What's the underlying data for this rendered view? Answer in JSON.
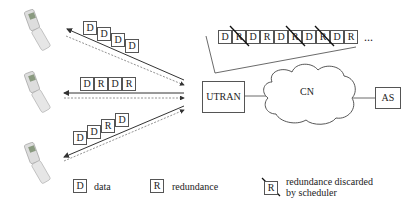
{
  "diagram": {
    "nodes": {
      "utran": "UTRAN",
      "cn": "CN",
      "as": "AS"
    },
    "ue_links": [
      {
        "ue": "ue-1",
        "packets": [
          "D",
          "D",
          "D",
          "D"
        ]
      },
      {
        "ue": "ue-2",
        "packets": [
          "D",
          "R",
          "D",
          "R"
        ]
      },
      {
        "ue": "ue-3",
        "packets": [
          "D",
          "D",
          "R",
          "D"
        ]
      }
    ],
    "queue": {
      "packets": [
        "D",
        "R",
        "D",
        "R",
        "D",
        "R",
        "D",
        "R",
        "D",
        "R"
      ],
      "discarded_indices": [
        1,
        5,
        7
      ],
      "ellipsis": "..."
    },
    "legend": {
      "data_symbol": "D",
      "data_label": "data",
      "redundancy_symbol": "R",
      "redundancy_label": "redundance",
      "discarded_symbol": "R",
      "discarded_label_line1": "redundance discarded",
      "discarded_label_line2": "by scheduler"
    }
  }
}
